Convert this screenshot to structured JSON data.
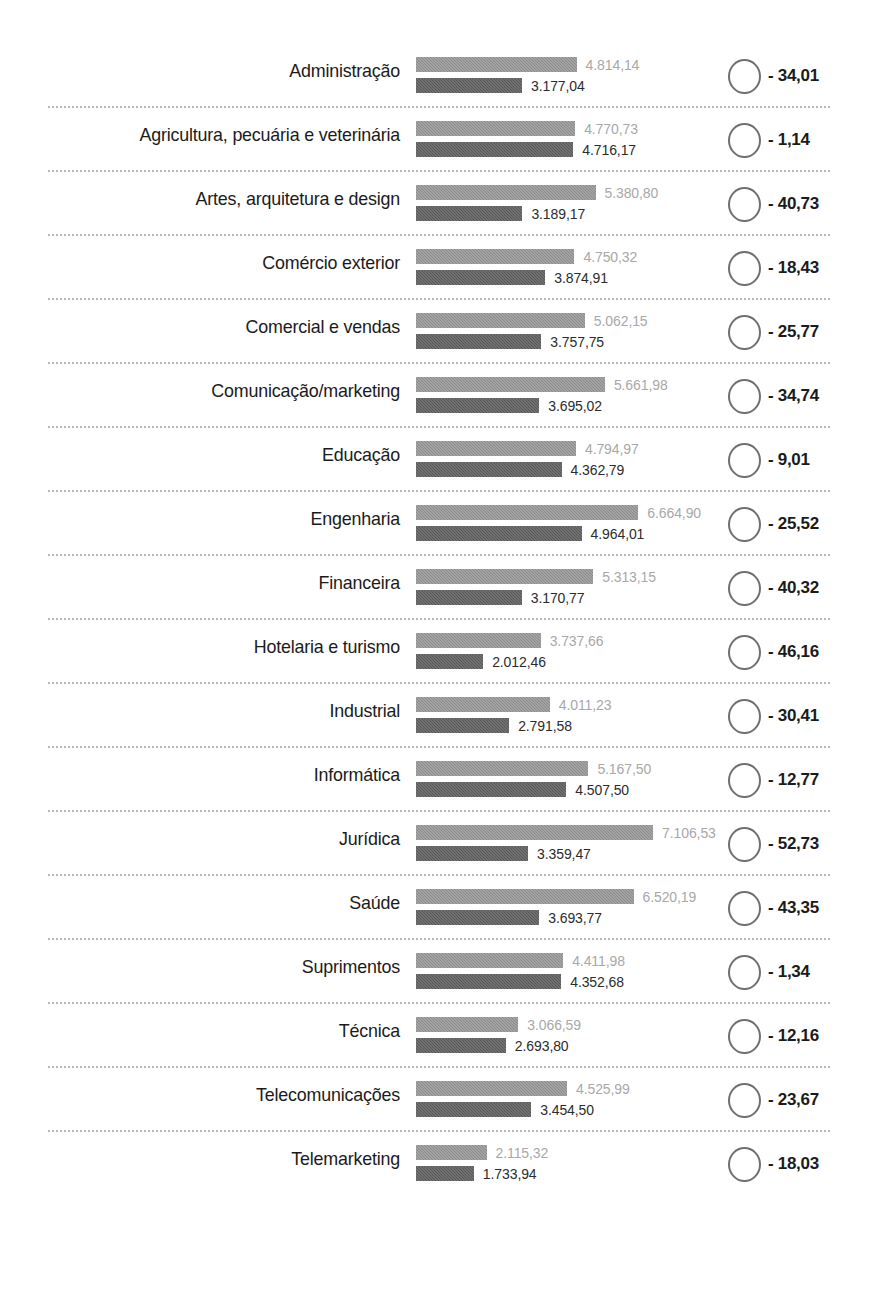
{
  "chart_data": {
    "type": "bar",
    "title": "",
    "subtitle": "",
    "xlabel": "",
    "ylabel": "",
    "orientation": "horizontal",
    "grid": false,
    "legend_position": "none",
    "axis_range": [
      0,
      7106.53
    ],
    "series": [
      {
        "name": "valor_superior",
        "style": "light-gray",
        "color": "#8d8d8d",
        "values": [
          4814.14,
          4770.73,
          5380.8,
          4750.32,
          5062.15,
          5661.98,
          4794.97,
          6664.9,
          5313.15,
          3737.66,
          4011.23,
          5167.5,
          7106.53,
          6520.19,
          4411.98,
          3066.59,
          4525.99,
          2115.32
        ]
      },
      {
        "name": "valor_inferior",
        "style": "dark-gray",
        "color": "#585858",
        "values": [
          3177.04,
          4716.17,
          3189.17,
          3874.91,
          3757.75,
          3695.02,
          4362.79,
          4964.01,
          3170.77,
          2012.46,
          2791.58,
          4507.5,
          3359.47,
          3693.77,
          4352.68,
          2693.8,
          3454.5,
          1733.94
        ]
      }
    ],
    "categories": [
      "Administração",
      "Agricultura, pecuária e veterinária",
      "Artes, arquitetura e design",
      "Comércio exterior",
      "Comercial e vendas",
      "Comunicação/marketing",
      "Educação",
      "Engenharia",
      "Financeira",
      "Hotelaria e turismo",
      "Industrial",
      "Informática",
      "Jurídica",
      "Saúde",
      "Suprimentos",
      "Técnica",
      "Telecomunicações",
      "Telemarketing"
    ],
    "variation_percent": [
      -34.01,
      -1.14,
      -40.73,
      -18.43,
      -25.77,
      -34.74,
      -9.01,
      -25.52,
      -40.32,
      -46.16,
      -30.41,
      -12.77,
      -52.73,
      -43.35,
      -1.34,
      -12.16,
      -23.67,
      -18.03
    ]
  },
  "rows": [
    {
      "label": "Administração",
      "top_value": "4.814,14",
      "bottom_value": "3.177,04",
      "top_num": 4814.14,
      "bottom_num": 3177.04,
      "pct": "- 34,01"
    },
    {
      "label": "Agricultura, pecuária e veterinária",
      "top_value": "4.770,73",
      "bottom_value": "4.716,17",
      "top_num": 4770.73,
      "bottom_num": 4716.17,
      "pct": "- 1,14"
    },
    {
      "label": "Artes, arquitetura e design",
      "top_value": "5.380,80",
      "bottom_value": "3.189,17",
      "top_num": 5380.8,
      "bottom_num": 3189.17,
      "pct": "- 40,73"
    },
    {
      "label": "Comércio exterior",
      "top_value": "4.750,32",
      "bottom_value": "3.874,91",
      "top_num": 4750.32,
      "bottom_num": 3874.91,
      "pct": "- 18,43"
    },
    {
      "label": "Comercial e vendas",
      "top_value": "5.062,15",
      "bottom_value": "3.757,75",
      "top_num": 5062.15,
      "bottom_num": 3757.75,
      "pct": "- 25,77"
    },
    {
      "label": "Comunicação/marketing",
      "top_value": "5.661,98",
      "bottom_value": "3.695,02",
      "top_num": 5661.98,
      "bottom_num": 3695.02,
      "pct": "- 34,74"
    },
    {
      "label": "Educação",
      "top_value": "4.794,97",
      "bottom_value": "4.362,79",
      "top_num": 4794.97,
      "bottom_num": 4362.79,
      "pct": "- 9,01"
    },
    {
      "label": "Engenharia",
      "top_value": "6.664,90",
      "bottom_value": "4.964,01",
      "top_num": 6664.9,
      "bottom_num": 4964.01,
      "pct": "- 25,52"
    },
    {
      "label": "Financeira",
      "top_value": "5.313,15",
      "bottom_value": "3.170,77",
      "top_num": 5313.15,
      "bottom_num": 3170.77,
      "pct": "- 40,32"
    },
    {
      "label": "Hotelaria e turismo",
      "top_value": "3.737,66",
      "bottom_value": "2.012,46",
      "top_num": 3737.66,
      "bottom_num": 2012.46,
      "pct": "- 46,16"
    },
    {
      "label": "Industrial",
      "top_value": "4.011,23",
      "bottom_value": "2.791,58",
      "top_num": 4011.23,
      "bottom_num": 2791.58,
      "pct": "- 30,41"
    },
    {
      "label": "Informática",
      "top_value": "5.167,50",
      "bottom_value": "4.507,50",
      "top_num": 5167.5,
      "bottom_num": 4507.5,
      "pct": "- 12,77"
    },
    {
      "label": "Jurídica",
      "top_value": "7.106,53",
      "bottom_value": "3.359,47",
      "top_num": 7106.53,
      "bottom_num": 3359.47,
      "pct": "- 52,73"
    },
    {
      "label": "Saúde",
      "top_value": "6.520,19",
      "bottom_value": "3.693,77",
      "top_num": 6520.19,
      "bottom_num": 3693.77,
      "pct": "- 43,35"
    },
    {
      "label": "Suprimentos",
      "top_value": "4.411,98",
      "bottom_value": "4.352,68",
      "top_num": 4411.98,
      "bottom_num": 4352.68,
      "pct": "- 1,34"
    },
    {
      "label": "Técnica",
      "top_value": "3.066,59",
      "bottom_value": "2.693,80",
      "top_num": 3066.59,
      "bottom_num": 2693.8,
      "pct": "- 12,16"
    },
    {
      "label": "Telecomunicações",
      "top_value": "4.525,99",
      "bottom_value": "3.454,50",
      "top_num": 4525.99,
      "bottom_num": 3454.5,
      "pct": "- 23,67"
    },
    {
      "label": "Telemarketing",
      "top_value": "2.115,32",
      "bottom_value": "1.733,94",
      "top_num": 2115.32,
      "bottom_num": 1733.94,
      "pct": "- 18,03"
    }
  ],
  "style": {
    "bar_light": "#8d8d8d",
    "bar_dark": "#585858",
    "label_color": "#1b1b1b",
    "value_light_color": "#a8a8a8",
    "value_dark_color": "#2c2c2c",
    "separator_color": "#b9b9b9",
    "circle_stroke": "#6f6f6f",
    "background": "#ffffff"
  },
  "scale": {
    "px_per_unit": 0.03336,
    "bar_origin_x": 416
  }
}
